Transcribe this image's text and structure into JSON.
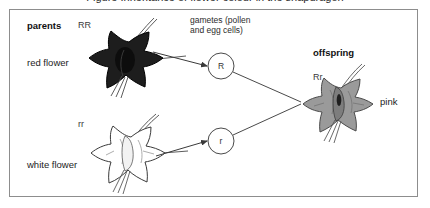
{
  "caption": {
    "text": "Figure   Inheritance of flower colour in the snapdragon"
  },
  "figure": {
    "border_color": "#8d8d8d",
    "background": "#ffffff"
  },
  "parents": {
    "heading": "parents",
    "red": {
      "genotype": "RR",
      "label": "red flower",
      "petal_color": "#1d1d1d",
      "outline_color": "#000000"
    },
    "white": {
      "genotype": "rr",
      "label": "white flower",
      "petal_color": "#ffffff",
      "outline_color": "#3a3a3a"
    }
  },
  "gametes": {
    "heading_line1": "gametes (pollen",
    "heading_line2": "and egg cells)",
    "circles": [
      {
        "allele": "R"
      },
      {
        "allele": "r"
      }
    ]
  },
  "offspring": {
    "heading": "offspring",
    "genotype": "Rr",
    "label": "pink",
    "petal_color": "#9a9a9a",
    "outline_color": "#4a4a4a"
  },
  "arrows": {
    "stroke_color": "#3a3a3a"
  }
}
